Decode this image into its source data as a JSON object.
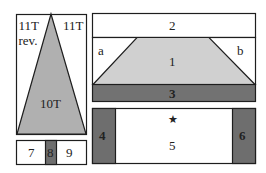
{
  "colors": {
    "outline": "#1e1e1e",
    "light_gray": "#bdbdbd",
    "mid_gray": "#a9a9a9",
    "dark_gray": "#6e6e6e",
    "white": "#ffffff"
  },
  "left_panel": {
    "label_top_left_line1": "11T",
    "label_top_left_line2": "rev.",
    "label_top_right": "11T",
    "triangle_label": "10T"
  },
  "bottom_left_panel": {
    "cells": [
      {
        "label": "7"
      },
      {
        "label": "8"
      },
      {
        "label": "9"
      }
    ]
  },
  "top_right_panel": {
    "header_label": "2",
    "left_corner_label": "a",
    "trapezoid_label": "1",
    "right_corner_label": "b",
    "bottom_band_label": "3"
  },
  "bottom_right_panel": {
    "left_side_label": "4",
    "center_label": "5",
    "star_symbol": "★",
    "right_side_label": "6"
  }
}
